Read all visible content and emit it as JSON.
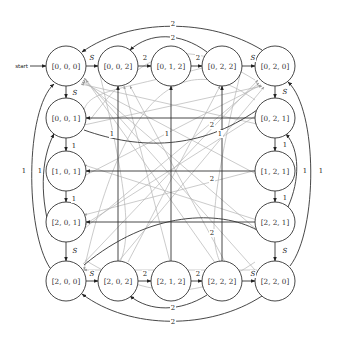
{
  "diagram": {
    "start_label": "start",
    "colors": {
      "stroke_dark": "#333333",
      "stroke_light": "#b5b5b5",
      "background": "#ffffff"
    },
    "node_radius": 20,
    "nodes": [
      {
        "id": "n000",
        "label": "[0, 0, 0]",
        "x": 66,
        "y": 66,
        "initial": true
      },
      {
        "id": "n002",
        "label": "[0, 0, 2]",
        "x": 118,
        "y": 66
      },
      {
        "id": "n012",
        "label": "[0, 1, 2]",
        "x": 171,
        "y": 66
      },
      {
        "id": "n022",
        "label": "[0, 2, 2]",
        "x": 222,
        "y": 66
      },
      {
        "id": "n020",
        "label": "[0, 2, 0]",
        "x": 275,
        "y": 66
      },
      {
        "id": "n001",
        "label": "[0, 0, 1]",
        "x": 66,
        "y": 118
      },
      {
        "id": "n101",
        "label": "[1, 0, 1]",
        "x": 66,
        "y": 171
      },
      {
        "id": "n201",
        "label": "[2, 0, 1]",
        "x": 66,
        "y": 222
      },
      {
        "id": "n021",
        "label": "[0, 2, 1]",
        "x": 275,
        "y": 118
      },
      {
        "id": "n121",
        "label": "[1, 2, 1]",
        "x": 275,
        "y": 171
      },
      {
        "id": "n221",
        "label": "[2, 2, 1]",
        "x": 275,
        "y": 222
      },
      {
        "id": "n200",
        "label": "[2, 0, 0]",
        "x": 66,
        "y": 281
      },
      {
        "id": "n202",
        "label": "[2, 0, 2]",
        "x": 118,
        "y": 281
      },
      {
        "id": "n212",
        "label": "[2, 1, 2]",
        "x": 171,
        "y": 281
      },
      {
        "id": "n222",
        "label": "[2, 2, 2]",
        "x": 222,
        "y": 281
      },
      {
        "id": "n220",
        "label": "[2, 2, 0]",
        "x": 275,
        "y": 281
      }
    ],
    "edge_labels": [
      {
        "text": "S",
        "x": 92,
        "y": 58,
        "italic": true
      },
      {
        "text": "2",
        "x": 145,
        "y": 58
      },
      {
        "text": "2",
        "x": 198,
        "y": 58
      },
      {
        "text": "S",
        "x": 253,
        "y": 58,
        "italic": true
      },
      {
        "text": "2",
        "x": 173,
        "y": 38
      },
      {
        "text": "2",
        "x": 173,
        "y": 24
      },
      {
        "text": "S",
        "x": 75,
        "y": 93,
        "italic": true
      },
      {
        "text": "1",
        "x": 74,
        "y": 146
      },
      {
        "text": "1",
        "x": 74,
        "y": 199
      },
      {
        "text": "S",
        "x": 75,
        "y": 251,
        "italic": true
      },
      {
        "text": "1",
        "x": 40,
        "y": 171
      },
      {
        "text": "1",
        "x": 24,
        "y": 171
      },
      {
        "text": "S",
        "x": 285,
        "y": 92,
        "italic": true
      },
      {
        "text": "1",
        "x": 285,
        "y": 145
      },
      {
        "text": "1",
        "x": 285,
        "y": 198
      },
      {
        "text": "S",
        "x": 285,
        "y": 251,
        "italic": true
      },
      {
        "text": "1",
        "x": 305,
        "y": 171
      },
      {
        "text": "1",
        "x": 321,
        "y": 171
      },
      {
        "text": "S",
        "x": 92,
        "y": 274,
        "italic": true
      },
      {
        "text": "2",
        "x": 145,
        "y": 274
      },
      {
        "text": "2",
        "x": 198,
        "y": 274
      },
      {
        "text": "S",
        "x": 253,
        "y": 274,
        "italic": true
      },
      {
        "text": "2",
        "x": 173,
        "y": 308
      },
      {
        "text": "2",
        "x": 173,
        "y": 322
      },
      {
        "text": "1",
        "x": 112,
        "y": 134
      },
      {
        "text": "1",
        "x": 167,
        "y": 134
      },
      {
        "text": "2",
        "x": 212,
        "y": 125
      },
      {
        "text": "1",
        "x": 220,
        "y": 134
      },
      {
        "text": "2",
        "x": 212,
        "y": 179
      },
      {
        "text": "2",
        "x": 212,
        "y": 233
      }
    ]
  }
}
